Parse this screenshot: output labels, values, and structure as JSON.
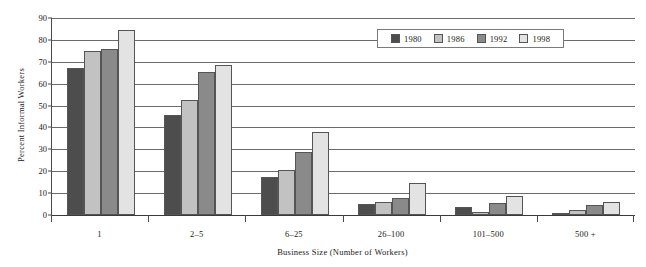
{
  "chart_data": {
    "type": "bar",
    "title": "",
    "xlabel": "Business Size (Number of Workers)",
    "ylabel": "Percent Informal Workers",
    "categories": [
      "1",
      "2–5",
      "6–25",
      "26–100",
      "101–500",
      "500 +"
    ],
    "series": [
      {
        "name": "1980",
        "color": "#4d4d4d",
        "values": [
          67,
          45.5,
          17.5,
          5,
          3.5,
          1
        ]
      },
      {
        "name": "1986",
        "color": "#c2c2c2",
        "values": [
          75,
          52.5,
          20.5,
          6,
          1.5,
          2.5
        ]
      },
      {
        "name": "1992",
        "color": "#8a8a8a",
        "values": [
          76,
          65.5,
          29,
          8,
          5.5,
          4.5
        ]
      },
      {
        "name": "1998",
        "color": "#e3e3e3",
        "values": [
          84.5,
          68.5,
          38,
          14.5,
          8.5,
          6
        ]
      }
    ],
    "ylim": [
      0,
      90
    ],
    "yticks": [
      0,
      10,
      20,
      30,
      40,
      50,
      60,
      70,
      80,
      90
    ],
    "ytick_labels": [
      "0",
      "10",
      "20",
      "30",
      "40",
      "50",
      "60",
      "70",
      "80",
      "90"
    ],
    "grid": true,
    "legend_position": "upper-right-inside",
    "legend_entries": [
      "1980",
      "1986",
      "1992",
      "1998"
    ]
  }
}
